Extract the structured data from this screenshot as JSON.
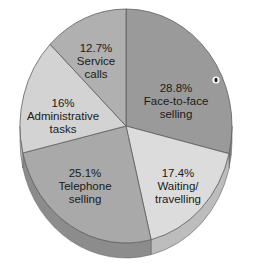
{
  "chart_data": {
    "type": "pie",
    "title": "",
    "style": "3d-pie",
    "start_angle_deg": 0,
    "direction": "clockwise",
    "slices": [
      {
        "label_pct": "28.8%",
        "label_line1": "Face-to-face",
        "label_line2": "selling",
        "name": "Face-to-face selling",
        "value": 28.8,
        "color": "#9a9a9a",
        "side_color": "#7e7e7e",
        "label_x": 176,
        "label_y": 92
      },
      {
        "label_pct": "17.4%",
        "label_line1": "Waiting/",
        "label_line2": "travelling",
        "name": "Waiting/travelling",
        "value": 17.4,
        "color": "#dcdcdc",
        "side_color": "#bdbdbd",
        "label_x": 178,
        "label_y": 177
      },
      {
        "label_pct": "25.1%",
        "label_line1": "Telephone",
        "label_line2": "selling",
        "name": "Telephone selling",
        "value": 25.1,
        "color": "#a9a9a9",
        "side_color": "#8c8c8c",
        "label_x": 85,
        "label_y": 177
      },
      {
        "label_pct": "16%",
        "label_line1": "Administrative",
        "label_line2": "tasks",
        "name": "Administrative tasks",
        "value": 16.0,
        "color": "#d3d3d3",
        "side_color": "#b5b5b5",
        "label_x": 63,
        "label_y": 107
      },
      {
        "label_pct": "12.7%",
        "label_line1": "Service",
        "label_line2": "calls",
        "name": "Service calls",
        "value": 12.7,
        "color": "#b0b0b0",
        "side_color": "#939393",
        "label_x": 96,
        "label_y": 52
      }
    ],
    "categories": [
      "Face-to-face selling",
      "Waiting/travelling",
      "Telephone selling",
      "Administrative tasks",
      "Service calls"
    ],
    "values": [
      28.8,
      17.4,
      25.1,
      16.0,
      12.7
    ],
    "legend": "none (labels inside slices)",
    "marker": {
      "x": 216,
      "y": 80,
      "color": "#222222"
    }
  }
}
